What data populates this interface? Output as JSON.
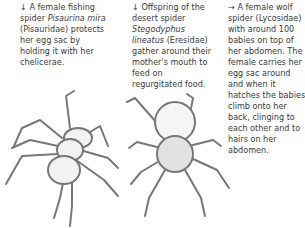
{
  "captions": [
    {
      "arrow": "↓",
      "parts": [
        "A female fishing spider ",
        "Pisaurina mira",
        " (Pisauridae) protects her egg sac by holding it with her chelicerae."
      ]
    },
    {
      "arrow": "↓",
      "parts": [
        "Offspring of the desert spider ",
        "Stegodyphus lineatus",
        " (Eresidae) gather around their mother's mouth to feed on regurgitated food."
      ]
    },
    {
      "arrow": "→",
      "parts": [
        "A female wolf spider (Lycosidae) with around 100 babies on top of her abdomen. The female carries her egg sac around and when it hatches the babies climb onto her back, clinging to each other and to hairs on her abdomen."
      ]
    }
  ],
  "illustrations": [
    {
      "name": "fishing-spider-illustration",
      "stroke": "#777777",
      "fill": "#f2f2f2"
    },
    {
      "name": "desert-spider-illustration",
      "stroke": "#777777",
      "fill": "#eeeeee"
    }
  ]
}
